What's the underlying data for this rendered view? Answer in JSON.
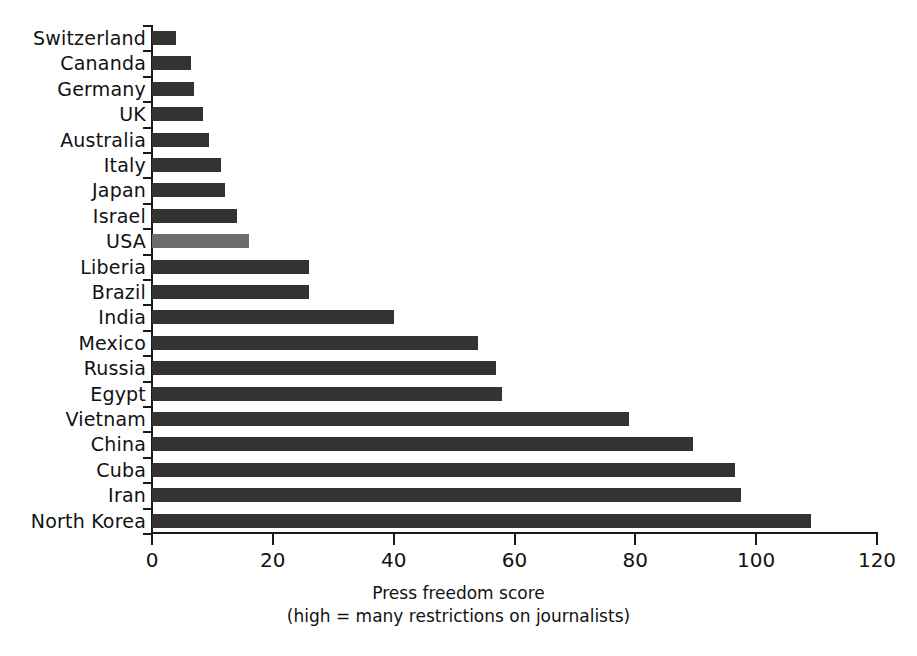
{
  "chart_data": {
    "type": "bar",
    "orientation": "horizontal",
    "title": "",
    "xlabel": "Press freedom score",
    "xlabel_sub": "(high = many restrictions on journalists)",
    "ylabel": "",
    "xlim": [
      0,
      120
    ],
    "xticks": [
      0,
      20,
      40,
      60,
      80,
      100,
      120
    ],
    "xtick_labels": [
      "0",
      "20",
      "40",
      "60",
      "80",
      "100",
      "120"
    ],
    "grid": false,
    "legend": false,
    "categories": [
      "Switzerland",
      "Cananda",
      "Germany",
      "UK",
      "Australia",
      "Italy",
      "Japan",
      "Israel",
      "USA",
      "Liberia",
      "Brazil",
      "India",
      "Mexico",
      "Russia",
      "Egypt",
      "Vietnam",
      "China",
      "Cuba",
      "Iran",
      "North Korea"
    ],
    "values": [
      4,
      6.5,
      7,
      8.5,
      9.5,
      11.5,
      12,
      14,
      16,
      26,
      26,
      40,
      54,
      57,
      58,
      79,
      89.5,
      96.5,
      97.5,
      109
    ],
    "highlight_category": "USA",
    "bar_color": "#333333",
    "highlight_color": "#6d6d6d",
    "background_color": "#ffffff",
    "axis_color": "#1a1a1a"
  }
}
